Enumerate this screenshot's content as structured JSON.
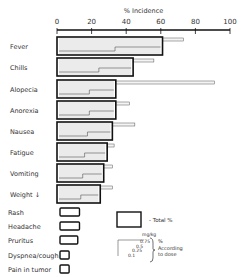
{
  "chart_data": {
    "type": "bar",
    "orientation": "horizontal",
    "title": "",
    "xlabel": "% Incidence",
    "ylabel": "",
    "xlim": [
      0,
      100
    ],
    "xticks": [
      0,
      20,
      40,
      60,
      80,
      100
    ],
    "categories": [
      "Fever",
      "Chills",
      "Alopecia",
      "Anorexia",
      "Nausea",
      "Fatigue",
      "Vomiting",
      "Weight ↓",
      "Rash",
      "Headache",
      "Pruritus",
      "Dyspnea/cough",
      "Pain in tumor"
    ],
    "series": [
      {
        "name": "Total %",
        "values": [
          61,
          44,
          34,
          34,
          32,
          29,
          27,
          25,
          13,
          13,
          12,
          7,
          7
        ]
      },
      {
        "name": "Max % according to dose",
        "values": [
          73,
          56,
          91,
          42,
          45,
          33,
          32,
          32,
          null,
          null,
          null,
          null,
          null
        ]
      }
    ],
    "dose_levels_mg_per_kg": [
      "0.75",
      "0.5",
      "0.25",
      "0.1"
    ],
    "legend": {
      "total_label": "- Total %",
      "dose_unit": "mg/kg",
      "dose_label_lines": [
        "%",
        "According",
        "to dose"
      ]
    }
  }
}
